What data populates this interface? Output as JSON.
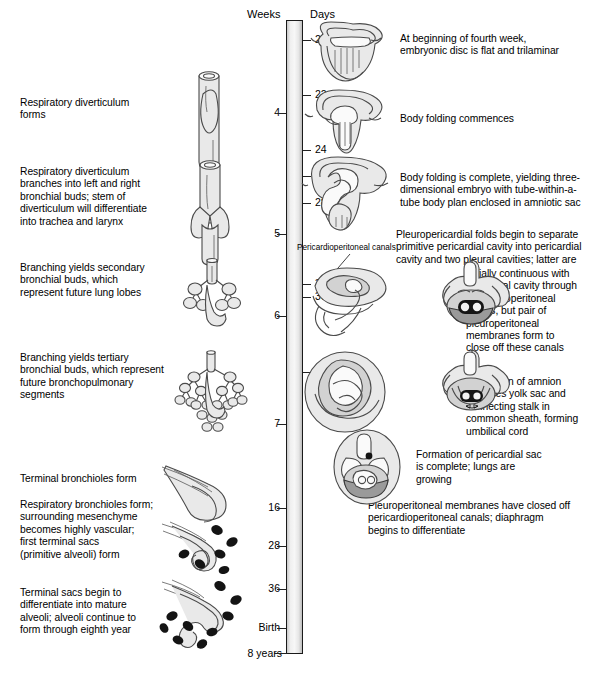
{
  "figure": {
    "axis_headers": {
      "weeks": "Weeks",
      "days": "Days"
    },
    "bottom_label": "8 years"
  },
  "timeline": {
    "weeks_ticks": [
      {
        "label": "4",
        "y": 113
      },
      {
        "label": "5",
        "y": 234
      },
      {
        "label": "6",
        "y": 316
      },
      {
        "label": "7",
        "y": 424
      },
      {
        "label": "16",
        "y": 508
      },
      {
        "label": "28",
        "y": 546
      },
      {
        "label": "36",
        "y": 589
      },
      {
        "label": "Birth",
        "y": 628
      }
    ],
    "days_ticks": [
      {
        "label": "21",
        "y": 40
      },
      {
        "label": "22",
        "y": 95
      },
      {
        "label": "24",
        "y": 150
      },
      {
        "label": "26",
        "y": 176
      },
      {
        "label": "28",
        "y": 203
      },
      {
        "label": "35",
        "y": 284
      },
      {
        "label": "36",
        "y": 297
      },
      {
        "label": "42",
        "y": 372
      }
    ]
  },
  "left_notes": [
    {
      "id": "respiratory-diverticulum-forms",
      "text": "Respiratory diverticulum\nforms",
      "x": 20,
      "y": 97
    },
    {
      "id": "diverticulum-branches",
      "text": "Respiratory diverticulum\nbranches into left and right\nbronchial buds; stem of\ndiverticulum will differentiate\ninto trachea and larynx",
      "x": 20,
      "y": 166
    },
    {
      "id": "secondary-bronchial-buds",
      "text": "Branching yields secondary\nbronchial buds, which\nrepresent future lung lobes",
      "x": 20,
      "y": 262
    },
    {
      "id": "tertiary-bronchial-buds",
      "text": "Branching yields tertiary\nbronchial buds, which represent\nfuture bronchopulmonary\nsegments",
      "x": 20,
      "y": 352
    },
    {
      "id": "terminal-bronchioles-form",
      "text": "Terminal bronchioles form",
      "x": 20,
      "y": 473
    },
    {
      "id": "respiratory-bronchioles-form",
      "text": "Respiratory bronchioles form;\nsurrounding mesenchyme\nbecomes highly vascular;\nfirst terminal sacs\n(primitive alveoli) form",
      "x": 20,
      "y": 499
    },
    {
      "id": "terminal-sacs-differentiate",
      "text": "Terminal sacs begin to\ndifferentiate into mature\nalveoli; alveoli continue to\nform through eighth year",
      "x": 20,
      "y": 587
    }
  ],
  "right_notes": [
    {
      "id": "fourth-week-trilaminar-disc",
      "text": "At beginning of fourth week,\nembryonic disc is flat and trilaminar",
      "x": 400,
      "y": 33
    },
    {
      "id": "body-folding-commences",
      "text": "Body folding commences",
      "x": 400,
      "y": 113
    },
    {
      "id": "body-folding-complete",
      "text": "Body folding is complete, yielding three-\ndimensional embryo with tube-within-a-\ntube body plan enclosed in amniotic sac",
      "x": 400,
      "y": 172
    },
    {
      "id": "pleuropericardial-folds",
      "text": "Pleuropericardial folds begin to separate\nprimitive pericardial cavity into pericardial\ncavity and two pleural cavities; latter are",
      "x": 396,
      "y": 229
    },
    {
      "id": "pleuropericardial-folds-cont",
      "text": "initially continuous with\nperitoneal cavity through\npericardioperitoneal\ncanals, but pair of\npleuroperitoneal\nmembranes form to\nclose off these canals",
      "x": 466,
      "y": 268
    },
    {
      "id": "amnion-expansion",
      "text": "Expansion of amnion\nencloses yolk sac and\nconnecting stalk in\ncommon sheath, forming\numbilical cord",
      "x": 466,
      "y": 376
    },
    {
      "id": "pericardial-sac-complete",
      "text": "Formation of pericardial sac\nis complete; lungs are\ngrowing",
      "x": 416,
      "y": 449
    },
    {
      "id": "pleuroperitoneal-membranes-closed",
      "text": "Pleuroperitoneal membranes have closed off\npericardioperitoneal canals; diaphragm\nbegins to differentiate",
      "x": 368,
      "y": 500
    }
  ],
  "callouts": [
    {
      "id": "pericardioperitoneal-canals",
      "text": "Pericardioperitoneal canals",
      "x": 297,
      "y": 247
    }
  ],
  "illustrations": [
    {
      "id": "lung-bud-stage-diverticulum",
      "label": "Respiratory diverticulum (tube)"
    },
    {
      "id": "lung-bud-stage-bronchial-buds",
      "label": "Left and right bronchial buds"
    },
    {
      "id": "lung-bud-stage-secondary-buds",
      "label": "Secondary bronchial buds"
    },
    {
      "id": "lung-bud-stage-tertiary-buds",
      "label": "Tertiary bronchial buds"
    },
    {
      "id": "lung-stage-terminal-bronchioles",
      "label": "Terminal bronchioles"
    },
    {
      "id": "lung-stage-respiratory-bronchioles",
      "label": "Respiratory bronchioles with capillaries"
    },
    {
      "id": "lung-stage-terminal-sacs",
      "label": "Terminal sacs and alveoli"
    },
    {
      "id": "embryo-day21-flat-disc",
      "label": "Flat trilaminar embryonic disc"
    },
    {
      "id": "embryo-day22-folding",
      "label": "Body folding commences"
    },
    {
      "id": "embryo-day26-folded",
      "label": "Body folding complete"
    },
    {
      "id": "embryo-day35-pericardioperitoneal",
      "label": "Pericardioperitoneal canals"
    },
    {
      "id": "embryo-cross-section-pleural",
      "label": "Cross section: pleural cavities"
    },
    {
      "id": "embryo-day42-umbilical",
      "label": "Amnion expansion, umbilical cord"
    },
    {
      "id": "embryo-cross-section-umbilical",
      "label": "Cross section: umbilical cord"
    },
    {
      "id": "embryo-cross-section-pericardial",
      "label": "Cross section: pericardial sac complete"
    }
  ]
}
